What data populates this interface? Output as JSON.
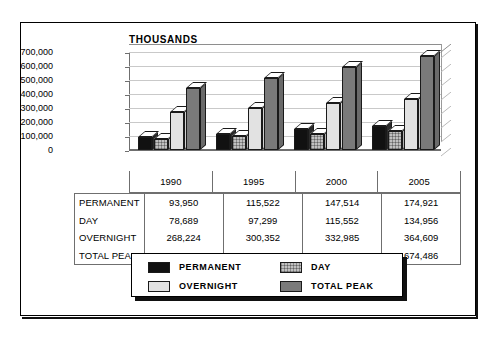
{
  "chart_data": {
    "type": "bar",
    "title": "",
    "axis_label": "THOUSANDS",
    "xlabel": "",
    "ylabel": "THOUSANDS",
    "categories": [
      "1990",
      "1995",
      "2000",
      "2005"
    ],
    "ylim": [
      0,
      700000
    ],
    "ytick_values": [
      0,
      100000,
      200000,
      300000,
      400000,
      500000,
      600000,
      700000
    ],
    "ytick_labels": [
      "0",
      "100,000",
      "200,000",
      "300,000",
      "400,000",
      "500,000",
      "600,000",
      "700,000"
    ],
    "grid": true,
    "legend_position": "bottom",
    "series": [
      {
        "name": "PERMANENT",
        "key": "permanent",
        "values": [
          93950,
          115522,
          147514,
          174921
        ],
        "labels": [
          "93,950",
          "115,522",
          "147,514",
          "174,921"
        ],
        "color": "#111111"
      },
      {
        "name": "DAY",
        "key": "day",
        "values": [
          78689,
          97299,
          115552,
          134956
        ],
        "labels": [
          "78,689",
          "97,299",
          "115,552",
          "134,956"
        ],
        "color": "#c0c0c0"
      },
      {
        "name": "OVERNIGHT",
        "key": "overnight",
        "values": [
          268224,
          300352,
          332985,
          364609
        ],
        "labels": [
          "268,224",
          "300,352",
          "332,985",
          "364,609"
        ],
        "color": "#e2e2e2"
      },
      {
        "name": "TOTAL PEAK",
        "key": "totalpeak",
        "values": [
          440863,
          513173,
          596051,
          674486
        ],
        "labels": [
          "440,863",
          "513,173",
          "596,051",
          "674,486"
        ],
        "color": "#7a7a7a"
      }
    ]
  },
  "table": {
    "column_headers": [
      "1990",
      "1995",
      "2000",
      "2005"
    ],
    "rows": [
      {
        "label": "PERMANENT",
        "values": [
          "93,950",
          "115,522",
          "147,514",
          "174,921"
        ]
      },
      {
        "label": "DAY",
        "values": [
          "78,689",
          "97,299",
          "115,552",
          "134,956"
        ]
      },
      {
        "label": "OVERNIGHT",
        "values": [
          "268,224",
          "300,352",
          "332,985",
          "364,609"
        ]
      },
      {
        "label": "TOTAL PEAK",
        "values": [
          "440,863",
          "513,173",
          "596,051",
          "674,486"
        ]
      }
    ]
  },
  "legend": {
    "items": [
      {
        "label": "PERMANENT",
        "key": "permanent"
      },
      {
        "label": "DAY",
        "key": "day"
      },
      {
        "label": "OVERNIGHT",
        "key": "overnight"
      },
      {
        "label": "TOTAL PEAK",
        "key": "totalpeak"
      }
    ]
  }
}
